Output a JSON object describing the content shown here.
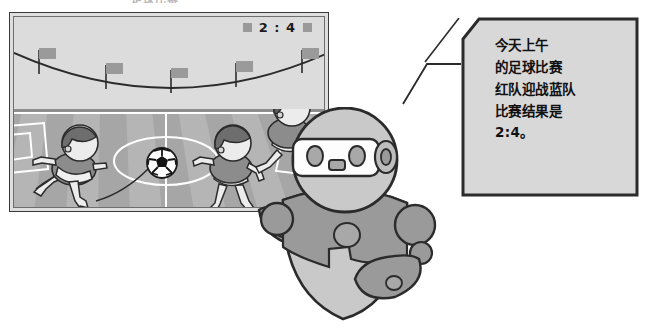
{
  "page": {
    "cut_off_title": "足球比赛",
    "background_color": "#ffffff"
  },
  "tv_panel": {
    "name": "soccer-match-screen",
    "frame_color": "#dedede",
    "border_color": "#3a3a3a",
    "stands": {
      "label": "stadium-stands",
      "background_color": "#dcdcdc",
      "flag_count": 5,
      "flag_color": "#9a9a9a"
    },
    "scoreboard": {
      "score_text": "2 : 4",
      "left_marker": "",
      "right_marker": "",
      "marker_color": "#9a9a9a"
    },
    "pitch": {
      "label": "soccer-pitch",
      "grass_color": "#a6a6a6",
      "stripe_color": "#b6b6b6",
      "line_color": "#ffffff",
      "ball": "soccer-ball",
      "players": [
        {
          "id": "player-left-kicker",
          "team": "red",
          "hair_color": "#6e6e6e",
          "shirt_color": "#8c8c8c",
          "shorts_color": "#f0f0f0"
        },
        {
          "id": "player-mid-right",
          "team": "red",
          "hair_color": "#6e6e6e",
          "shirt_color": "#8c8c8c",
          "shorts_color": "#f0f0f0"
        },
        {
          "id": "player-far-right",
          "team": "blue",
          "hair_color": "#5a5a5a",
          "shirt_color": "#8c8c8c",
          "shorts_color": "#f0f0f0"
        }
      ]
    }
  },
  "speech_bubble": {
    "name": "robot-speech-bubble",
    "fill_color": "#d8d8d8",
    "border_color": "#2b2b2b",
    "lines": [
      "今天上午",
      "的足球比赛",
      "红队迎战蓝队",
      "比赛结果是",
      "2:4。"
    ]
  },
  "robot": {
    "name": "assistant-robot",
    "body_color": "#9a9a9a",
    "light_color": "#c9c9c9",
    "outline_color": "#2b2b2b",
    "visor_color": "#fdfdfd",
    "face": {
      "eyes": 2,
      "mouth": "square-mouth",
      "ear_dial": "side-dial"
    },
    "parts": [
      "head",
      "visor",
      "left-arm",
      "right-arm",
      "torso",
      "chest-button"
    ]
  }
}
